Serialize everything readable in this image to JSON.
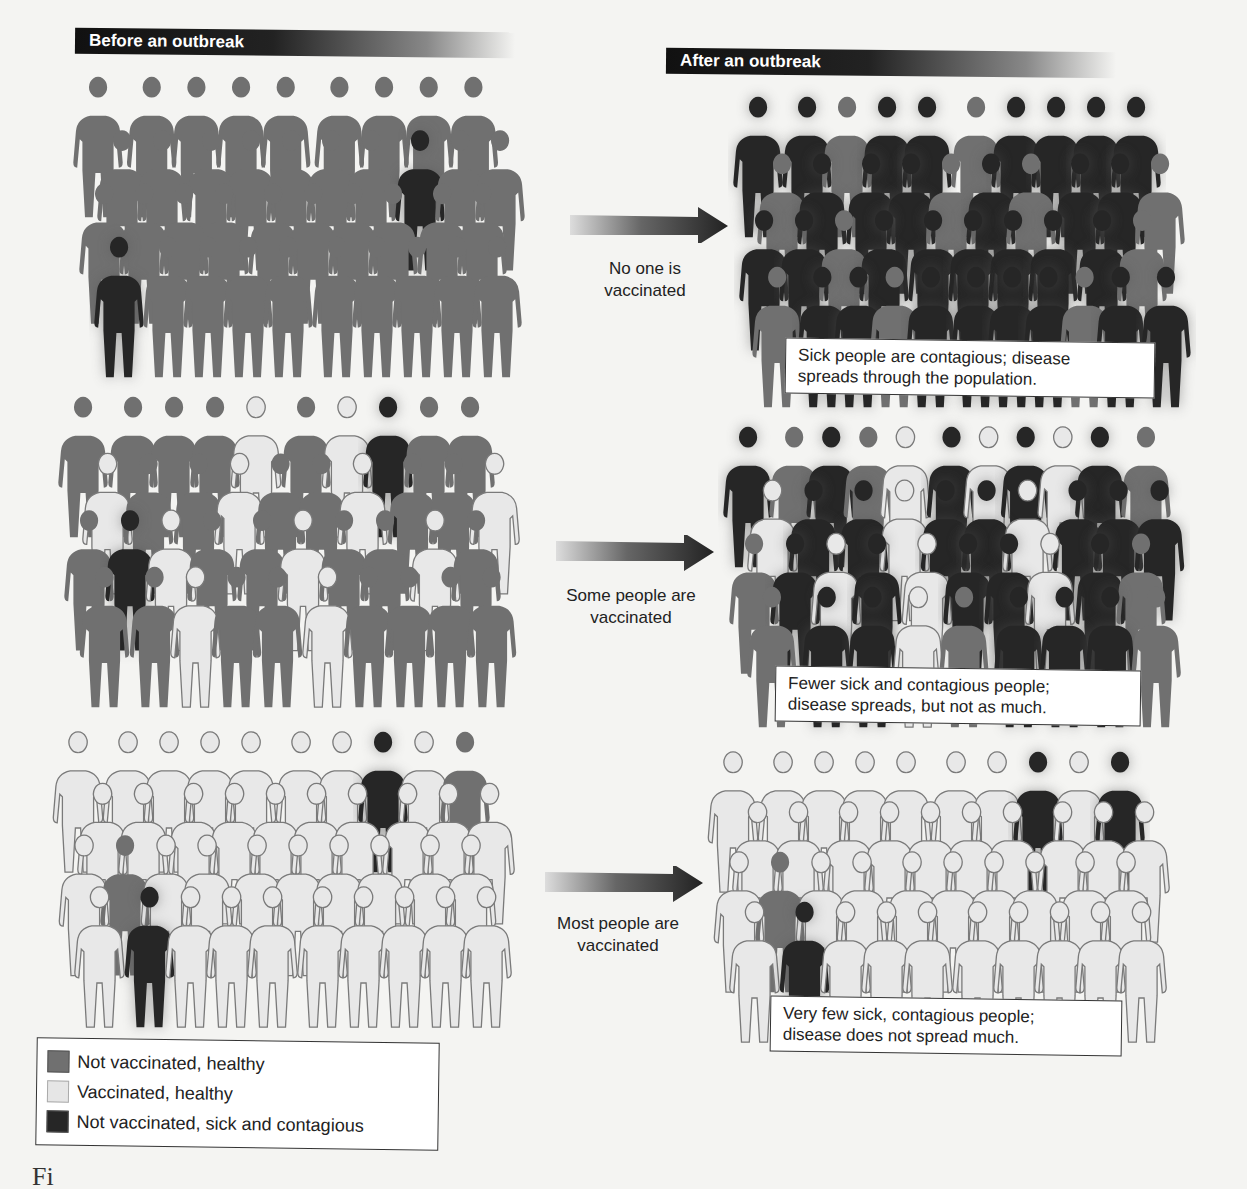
{
  "headers": {
    "before": "Before an outbreak",
    "after": "After an outbreak"
  },
  "scenarios": [
    {
      "id": "none",
      "arrow_label_line1": "No one is",
      "arrow_label_line2": "vaccinated",
      "caption_line1": "Sick people are contagious; disease",
      "caption_line2": "spreads through the population."
    },
    {
      "id": "some",
      "arrow_label_line1": "Some people are",
      "arrow_label_line2": "vaccinated",
      "caption_line1": "Fewer sick and contagious people;",
      "caption_line2": "disease spreads, but not as much."
    },
    {
      "id": "most",
      "arrow_label_line1": "Most people are",
      "arrow_label_line2": "vaccinated",
      "caption_line1": "Very few sick, contagious people;",
      "caption_line2": "disease does not spread much."
    }
  ],
  "legend": {
    "items": [
      {
        "label": "Not vaccinated, healthy",
        "color": "#707070"
      },
      {
        "label": "Vaccinated, healthy",
        "color": "#e6e6e6"
      },
      {
        "label": "Not vaccinated, sick and contagious",
        "color": "#262626"
      }
    ]
  },
  "figure_caption": "Fi",
  "colors": {
    "unvaccinated_healthy": "#707070",
    "vaccinated_healthy": "#e8e8e8",
    "sick": "#262626",
    "outline": "#7a7a7a"
  }
}
